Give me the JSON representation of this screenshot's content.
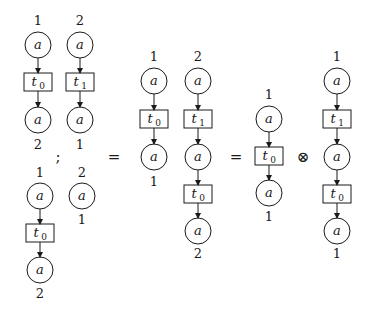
{
  "diagram": {
    "operators": {
      "seq": ";",
      "eq1": "=",
      "eq2": "=",
      "tensor": "⊗"
    },
    "place_token": "a",
    "transition_prefix": "t",
    "nets": [
      {
        "id": "top-left",
        "columns": [
          {
            "top_label": "1",
            "transition": "0",
            "bottom_label": "2"
          },
          {
            "top_label": "2",
            "transition": "1",
            "bottom_label": "1"
          }
        ]
      },
      {
        "id": "bottom-left",
        "columns": [
          {
            "top_label": "1",
            "transition": "0",
            "bottom_label": "2"
          },
          {
            "top_label": "2",
            "bottom_label": "1"
          }
        ]
      },
      {
        "id": "middle",
        "columns": [
          {
            "top_label": "1",
            "transition": "0",
            "bottom_label": "1"
          },
          {
            "top_label": "2",
            "transitions": [
              "1",
              "0"
            ],
            "bottom_label": "2"
          }
        ]
      },
      {
        "id": "right-a",
        "columns": [
          {
            "top_label": "1",
            "transition": "0",
            "bottom_label": "1"
          }
        ]
      },
      {
        "id": "right-b",
        "columns": [
          {
            "top_label": "1",
            "transitions": [
              "1",
              "0"
            ],
            "bottom_label": "1"
          }
        ]
      }
    ]
  },
  "labels": {
    "tl_c1_top": "1",
    "tl_c1_bot": "2",
    "tl_c2_top": "2",
    "tl_c2_bot": "1",
    "tl_c1_t": "0",
    "tl_c2_t": "1",
    "bl_c1_top": "1",
    "bl_c1_bot": "2",
    "bl_c2_top": "2",
    "bl_c2_bot": "1",
    "bl_c1_t": "0",
    "m_c1_top": "1",
    "m_c1_bot": "1",
    "m_c2_top": "2",
    "m_c2_bot": "2",
    "m_c1_t": "0",
    "m_c2_t1": "1",
    "m_c2_t2": "0",
    "ra_top": "1",
    "ra_bot": "1",
    "ra_t": "0",
    "rb_top": "1",
    "rb_bot": "1",
    "rb_t1": "1",
    "rb_t2": "0",
    "a": "a",
    "t": "t"
  }
}
